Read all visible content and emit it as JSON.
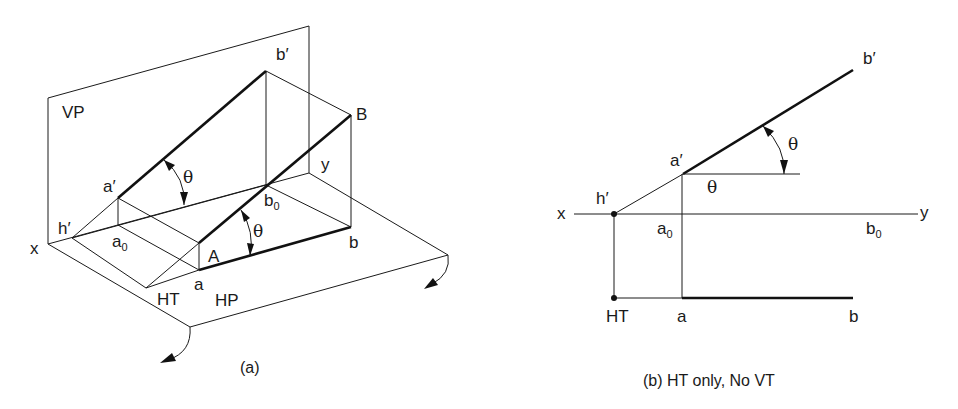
{
  "figure_a": {
    "caption": "(a)",
    "labels": {
      "vp": "VP",
      "hp": "HP",
      "x": "x",
      "y": "y",
      "h_prime": "h′",
      "a_prime": "a′",
      "b_prime": "b′",
      "a": "a",
      "b": "b",
      "A": "A",
      "B": "B",
      "a0_base": "a",
      "a0_sub": "0",
      "b0_base": "b",
      "b0_sub": "0",
      "ht": "HT",
      "theta_front": "θ",
      "theta_true": "θ"
    }
  },
  "figure_b": {
    "caption": "(b) HT only, No VT",
    "labels": {
      "x": "x",
      "y": "y",
      "h_prime": "h′",
      "a_prime": "a′",
      "b_prime": "b′",
      "a": "a",
      "b": "b",
      "a0_base": "a",
      "a0_sub": "0",
      "b0_base": "b",
      "b0_sub": "0",
      "ht": "HT",
      "theta_arc": "θ",
      "theta_horiz": "θ"
    }
  },
  "colors": {
    "line": "#1a1a1a",
    "background": "#ffffff"
  }
}
